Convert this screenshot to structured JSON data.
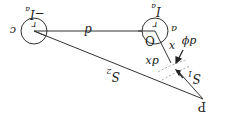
{
  "diagram": {
    "orientation": "rotated 180 degrees",
    "left_circle": {
      "center_label": "r",
      "side_label": "c",
      "current_label": "−I",
      "current_sub": "a"
    },
    "right_circle": {
      "center_label": "r",
      "origin_label": "O",
      "side_label": "a",
      "current_label": "I",
      "current_sub": "a"
    },
    "separation_label": "d",
    "point_label": "P",
    "s1_label": "S",
    "s1_sub": "1",
    "s2_label": "S",
    "s2_sub": "2",
    "x_label": "x",
    "dx_label": "dx",
    "dphi_label": "dϕ",
    "colors": {
      "line": "#333333",
      "dashed": "#888888",
      "background": "#ffffff"
    }
  }
}
